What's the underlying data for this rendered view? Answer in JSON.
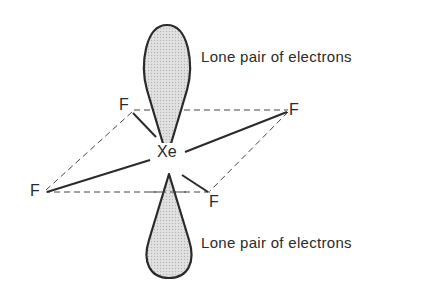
{
  "diagram": {
    "central_atom": "Xe",
    "ligands": [
      "F",
      "F",
      "F",
      "F"
    ],
    "lone_pair_top_label": "Lone pair of electrons",
    "lone_pair_bottom_label": "Lone pair of electrons",
    "colors": {
      "line": "#2a2a2a",
      "lobe_fill": "#d4d4d4",
      "background": "#ffffff"
    }
  }
}
